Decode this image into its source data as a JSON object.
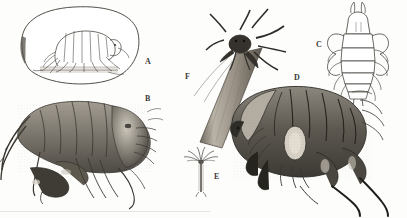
{
  "plate": {
    "title": "Amphipod crustacean illustration plate",
    "width": 407,
    "height": 218,
    "background_color": "#fdfdfc",
    "ink_color": "#3a3a38",
    "medium": "engraving / stipple line drawing",
    "bottom_edge_artifact": "faint scan line"
  },
  "panels": [
    {
      "id": "A",
      "label": "A",
      "label_x": 145,
      "label_y": 58,
      "subject": "amphipod standing on substrate inside oval field of view",
      "view": "lateral line drawing",
      "has_oval_frame": true,
      "shading": "light outline with hatched substrate band"
    },
    {
      "id": "B",
      "label": "B",
      "label_x": 145,
      "label_y": 95,
      "subject": "amphipod with long segmented antennae and gnathopods",
      "view": "lateral, detailed tonal engraving",
      "has_oval_frame": false,
      "shading": "dense stipple and cross-hatching"
    },
    {
      "id": "C",
      "label": "C",
      "label_x": 316,
      "label_y": 41,
      "subject": "crustacean with paired head horns and segmented pleon",
      "view": "dorsal outline drawing",
      "has_oval_frame": false,
      "shading": "fine outline, minimal tone"
    },
    {
      "id": "D",
      "label": "D",
      "label_x": 294,
      "label_y": 74,
      "subject": "large amphipod with arched segmented carapace and hooked claws",
      "view": "lateral, heavy tonal engraving",
      "has_oval_frame": false,
      "shading": "darkest rendering on the plate"
    },
    {
      "id": "E",
      "label": "E",
      "label_x": 214,
      "label_y": 173,
      "subject": "minute stalked organism with radiating arms",
      "view": "whole animal, small scale",
      "has_oval_frame": false,
      "shading": "fine line"
    },
    {
      "id": "F",
      "label": "F",
      "label_x": 185,
      "label_y": 73,
      "subject": "long-legged caprellid-like animal clinging to a diagonal tube",
      "view": "animal atop cylindrical stalk",
      "has_oval_frame": false,
      "shading": "shaded cylinder with dark limbs"
    }
  ]
}
